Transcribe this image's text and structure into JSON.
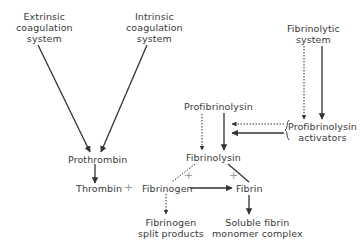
{
  "diagram": {
    "type": "flowchart",
    "nodes": {
      "extrinsic": {
        "line1": "Extrinsic",
        "line2": "coagulation",
        "line3": "system"
      },
      "intrinsic": {
        "line1": "Intrinsic",
        "line2": "coagulation",
        "line3": "system"
      },
      "fibrinolytic_system": {
        "line1": "Fibrinolytic",
        "line2": "system"
      },
      "prothrombin": {
        "label": "Prothrombin"
      },
      "thrombin": {
        "label": "Thrombin"
      },
      "profibrinolysin": {
        "label": "Profibrinolysin"
      },
      "profibrinolysin_activators": {
        "line1": "Profibrinolysin",
        "line2": "activators"
      },
      "fibrinolysin": {
        "label": "Fibrinolysin"
      },
      "fibrinogen": {
        "label": "Fibrinogen"
      },
      "fibrin": {
        "label": "Fibrin"
      },
      "fibrinogen_split_products": {
        "line1": "Fibrinogen",
        "line2": "split products"
      },
      "soluble_fibrin_monomer_complex": {
        "line1": "Soluble fibrin",
        "line2": "monomer complex"
      }
    },
    "operators": {
      "thrombin_plus_fibrinogen": "+",
      "fibrinolysin_fibrinogen_plus": "+",
      "fibrinolysin_fibrin_plus": "+"
    },
    "edges": [
      {
        "from": "Extrinsic coagulation system",
        "to": "Prothrombin",
        "style": "solid"
      },
      {
        "from": "Intrinsic coagulation system",
        "to": "Prothrombin",
        "style": "solid"
      },
      {
        "from": "Prothrombin",
        "to": "Thrombin",
        "style": "solid"
      },
      {
        "from": "Fibrinogen",
        "to": "Fibrin",
        "style": "solid"
      },
      {
        "from": "Fibrinogen",
        "to": "Fibrinogen split products",
        "style": "dotted"
      },
      {
        "from": "Fibrin",
        "to": "Soluble fibrin monomer complex",
        "style": "solid"
      },
      {
        "from": "Fibrinolytic system",
        "to": "Profibrinolysin activators",
        "style": "dotted"
      },
      {
        "from": "Fibrinolytic system",
        "to": "Profibrinolysin activators",
        "style": "solid"
      },
      {
        "from": "Profibrinolysin activators",
        "to": "Profibrinolysin→Fibrinolysin",
        "style": "dotted"
      },
      {
        "from": "Profibrinolysin activators",
        "to": "Profibrinolysin→Fibrinolysin",
        "style": "solid"
      },
      {
        "from": "Profibrinolysin",
        "to": "Fibrinolysin",
        "style": "dotted"
      },
      {
        "from": "Profibrinolysin",
        "to": "Fibrinolysin",
        "style": "solid"
      },
      {
        "from": "Fibrinolysin",
        "to": "Fibrinogen",
        "style": "dotted"
      },
      {
        "from": "Fibrinolysin",
        "to": "Fibrin",
        "style": "solid"
      }
    ],
    "colors": {
      "line": "#333333",
      "text": "#3a3a3a",
      "plus": "#9a9a9a"
    }
  }
}
